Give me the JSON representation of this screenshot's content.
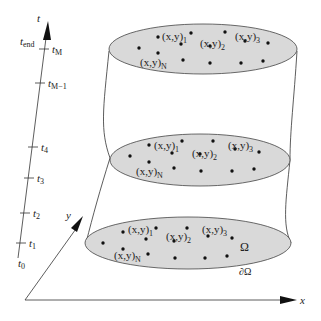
{
  "diagram": {
    "colors": {
      "line": "#333333",
      "ellipse_fill": "#d9d9d9",
      "point": "#111111",
      "background": "#ffffff"
    },
    "time_axis": {
      "label": "t",
      "end_label_main": "t",
      "end_label_sub": "end",
      "ticks": [
        {
          "main": "t",
          "sub": "M",
          "x": 44,
          "y": 49
        },
        {
          "main": "t",
          "sub": "M−1",
          "x": 40,
          "y": 83
        },
        {
          "main": "t",
          "sub": "4",
          "x": 33,
          "y": 147
        },
        {
          "main": "t",
          "sub": "3",
          "x": 29,
          "y": 178
        },
        {
          "main": "t",
          "sub": "2",
          "x": 25,
          "y": 213
        },
        {
          "main": "t",
          "sub": "1",
          "x": 21,
          "y": 243
        }
      ],
      "start_label_main": "t",
      "start_label_sub": "0"
    },
    "axes": {
      "x_label": "x",
      "y_label": "y"
    },
    "domain_labels": {
      "interior": "Ω",
      "boundary": "∂Ω"
    },
    "point_labels": {
      "p1_main": "(x,y)",
      "p1_sub": "1",
      "p2_main": "(x,y)",
      "p2_sub": "2",
      "p3_main": "(x,y)",
      "p3_sub": "3",
      "pN_main": "(x,y)",
      "pN_sub": "N"
    },
    "time_levels": [
      {
        "name": "top",
        "cx": 203,
        "cy": 49,
        "rx": 94,
        "ry": 25,
        "points": [
          [
            158,
            37
          ],
          [
            191,
            33
          ],
          [
            181,
            44
          ],
          [
            225,
            32
          ],
          [
            210,
            46
          ],
          [
            245,
            41
          ],
          [
            268,
            43
          ],
          [
            139,
            48
          ],
          [
            158,
            53
          ],
          [
            183,
            60
          ],
          [
            210,
            63
          ],
          [
            241,
            63
          ],
          [
            263,
            61
          ]
        ],
        "labels": {
          "p1": [
            162,
            36
          ],
          "p2": [
            200,
            46
          ],
          "p3": [
            235,
            38
          ],
          "pN": [
            140,
            64
          ]
        }
      },
      {
        "name": "middle",
        "cx": 200,
        "cy": 160,
        "rx": 90,
        "ry": 26,
        "points": [
          [
            149,
            145
          ],
          [
            182,
            141
          ],
          [
            172,
            153
          ],
          [
            213,
            141
          ],
          [
            200,
            154
          ],
          [
            235,
            149
          ],
          [
            259,
            152
          ],
          [
            130,
            156
          ],
          [
            149,
            162
          ],
          [
            174,
            168
          ],
          [
            201,
            171
          ],
          [
            232,
            171
          ],
          [
            254,
            169
          ]
        ],
        "labels": {
          "p1": [
            154,
            145
          ],
          "p2": [
            192,
            157
          ],
          "p3": [
            228,
            148
          ],
          "pN": [
            136,
            172
          ]
        }
      },
      {
        "name": "bottom",
        "cx": 188,
        "cy": 243,
        "rx": 103,
        "ry": 26,
        "points": [
          [
            123,
            232
          ],
          [
            156,
            228
          ],
          [
            146,
            239
          ],
          [
            187,
            228
          ],
          [
            174,
            241
          ],
          [
            208,
            236
          ],
          [
            232,
            238
          ],
          [
            103,
            243
          ],
          [
            123,
            249
          ],
          [
            148,
            254
          ],
          [
            175,
            258
          ],
          [
            205,
            258
          ],
          [
            227,
            256
          ]
        ],
        "labels": {
          "p1": [
            128,
            232
          ],
          "p2": [
            166,
            245
          ],
          "p3": [
            202,
            236
          ],
          "pN": [
            114,
            259
          ]
        }
      }
    ]
  }
}
